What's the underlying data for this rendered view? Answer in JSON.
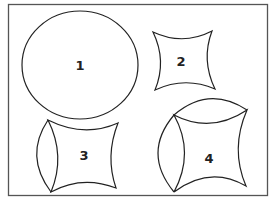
{
  "figure": {
    "frame": {
      "x": 8,
      "y": 4,
      "width": 260,
      "height": 192,
      "stroke": "#555555"
    },
    "stroke_color": "#222222",
    "shapes": [
      {
        "id": "1",
        "label": "1",
        "kind": "circle",
        "description": "circle"
      },
      {
        "id": "2",
        "label": "2",
        "kind": "concave-square",
        "description": "four-pointed concave square (astroid-like)"
      },
      {
        "id": "3",
        "label": "3",
        "kind": "concave-square-with-left-lens",
        "description": "concave square with a lens segment on the left side"
      },
      {
        "id": "4",
        "label": "4",
        "kind": "concave-square-with-top-and-left-lens",
        "description": "concave square with lens segments on the top and left sides"
      }
    ]
  }
}
